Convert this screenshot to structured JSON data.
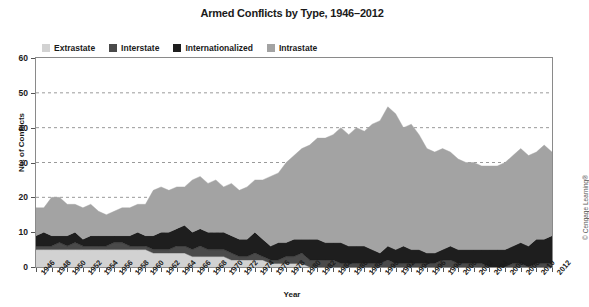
{
  "chart_data": {
    "type": "area",
    "title": "Armed Conflicts by Type, 1946–2012",
    "subtitle": "",
    "xlabel": "Year",
    "ylabel": "No. of Conflicts",
    "stacked": true,
    "grid": true,
    "grid_axis": "y",
    "legend_position": "top-left-inside",
    "ylim": [
      0,
      60
    ],
    "yticks": [
      0,
      10,
      20,
      30,
      40,
      50,
      60
    ],
    "ytick_labels": [
      "0",
      "10",
      "20",
      "30",
      "40",
      "50",
      "60"
    ],
    "xlim": [
      1946,
      2012
    ],
    "xtick_step": 2,
    "xtick_labels": [
      "1946",
      "1948",
      "1950",
      "1952",
      "1954",
      "1956",
      "1958",
      "1960",
      "1962",
      "1964",
      "1966",
      "1968",
      "1970",
      "1972",
      "1974",
      "1976",
      "1978",
      "1980",
      "1982",
      "1984",
      "1986",
      "1988",
      "1990",
      "1992",
      "1994",
      "1996",
      "1998",
      "2000",
      "2002",
      "2004",
      "2006",
      "2008",
      "2010",
      "2012"
    ],
    "x": [
      1946,
      1947,
      1948,
      1949,
      1950,
      1951,
      1952,
      1953,
      1954,
      1955,
      1956,
      1957,
      1958,
      1959,
      1960,
      1961,
      1962,
      1963,
      1964,
      1965,
      1966,
      1967,
      1968,
      1969,
      1970,
      1971,
      1972,
      1973,
      1974,
      1975,
      1976,
      1977,
      1978,
      1979,
      1980,
      1981,
      1982,
      1983,
      1984,
      1985,
      1986,
      1987,
      1988,
      1989,
      1990,
      1991,
      1992,
      1993,
      1994,
      1995,
      1996,
      1997,
      1998,
      1999,
      2000,
      2001,
      2002,
      2003,
      2004,
      2005,
      2006,
      2007,
      2008,
      2009,
      2010,
      2011,
      2012
    ],
    "series": [
      {
        "name": "Extrastate",
        "color": "#d2d2d2",
        "values": [
          5,
          5,
          5,
          5,
          5,
          5,
          5,
          5,
          5,
          5,
          5,
          5,
          5,
          5,
          5,
          4,
          4,
          4,
          4,
          4,
          3,
          3,
          3,
          3,
          3,
          2,
          2,
          2,
          2,
          2,
          1,
          1,
          1,
          1,
          1,
          0,
          0,
          0,
          0,
          0,
          0,
          0,
          0,
          0,
          0,
          0,
          0,
          0,
          0,
          0,
          0,
          0,
          0,
          0,
          0,
          0,
          0,
          0,
          0,
          0,
          0,
          0,
          0,
          0,
          0,
          0,
          0
        ]
      },
      {
        "name": "Interstate",
        "color": "#4a4a4a",
        "values": [
          1,
          1,
          1,
          2,
          1,
          2,
          1,
          1,
          1,
          1,
          2,
          2,
          1,
          1,
          1,
          1,
          1,
          1,
          2,
          2,
          2,
          3,
          2,
          2,
          2,
          2,
          1,
          1,
          2,
          1,
          1,
          1,
          2,
          2,
          3,
          2,
          2,
          2,
          2,
          1,
          1,
          1,
          1,
          1,
          1,
          2,
          1,
          1,
          1,
          1,
          1,
          1,
          2,
          2,
          1,
          1,
          1,
          1,
          0,
          0,
          0,
          1,
          1,
          0,
          1,
          1,
          1
        ]
      },
      {
        "name": "Internationalized",
        "color": "#1e1e1e",
        "values": [
          3,
          4,
          3,
          2,
          3,
          3,
          2,
          3,
          3,
          3,
          2,
          2,
          3,
          4,
          3,
          4,
          5,
          5,
          5,
          6,
          5,
          5,
          5,
          5,
          5,
          5,
          5,
          5,
          6,
          5,
          4,
          5,
          4,
          5,
          4,
          6,
          6,
          5,
          5,
          6,
          5,
          5,
          5,
          4,
          3,
          4,
          4,
          5,
          4,
          4,
          3,
          3,
          3,
          4,
          4,
          4,
          4,
          4,
          5,
          5,
          5,
          5,
          6,
          6,
          7,
          7,
          8
        ]
      },
      {
        "name": "Intrastate",
        "color": "#a3a3a3",
        "values": [
          8,
          7,
          11,
          11,
          9,
          8,
          9,
          9,
          7,
          6,
          7,
          8,
          8,
          8,
          9,
          13,
          13,
          12,
          12,
          11,
          15,
          15,
          14,
          15,
          13,
          15,
          14,
          15,
          15,
          17,
          20,
          20,
          23,
          24,
          26,
          27,
          29,
          30,
          31,
          33,
          32,
          34,
          33,
          36,
          38,
          40,
          39,
          34,
          36,
          33,
          30,
          29,
          29,
          27,
          26,
          25,
          25,
          24,
          24,
          24,
          25,
          26,
          27,
          26,
          25,
          27,
          24
        ]
      }
    ],
    "totals_note": "Stacked totals peak near 52 in 1991–1992",
    "copyright": "© Cengage Learning®"
  },
  "legend": {
    "items": [
      {
        "label": "Extrastate",
        "color": "#d2d2d2"
      },
      {
        "label": "Interstate",
        "color": "#4a4a4a"
      },
      {
        "label": "Internationalized",
        "color": "#1e1e1e"
      },
      {
        "label": "Intrastate",
        "color": "#a3a3a3"
      }
    ]
  },
  "colors": {
    "frame": "#8a8a8a",
    "gridline": "#9a9a9a",
    "text": "#1a1a1a",
    "background": "#ffffff"
  }
}
